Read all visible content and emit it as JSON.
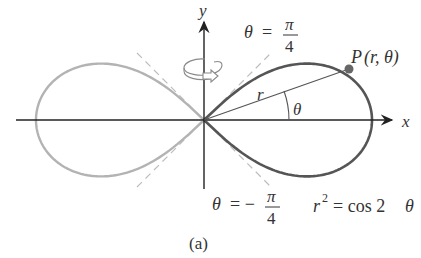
{
  "figure": {
    "caption": "(a)",
    "equation": {
      "lhs_var": "r",
      "exponent": "2",
      "rhs": "= cos 2",
      "rhs_var": "θ"
    },
    "axes": {
      "x_label": "x",
      "y_label": "y"
    },
    "upper_asymptote": {
      "var": "θ",
      "eq": "=",
      "num": "π",
      "den": "4"
    },
    "lower_asymptote": {
      "var": "θ",
      "eq": "= −",
      "num": "π",
      "den": "4"
    },
    "point": {
      "label": "P(r, θ)",
      "P": "P",
      "args": "(r, θ)"
    },
    "radius_label": "r",
    "angle_label": "θ",
    "rotation_icon": "rotate-about-y-axis-icon",
    "colors": {
      "curve_right": "#555555",
      "curve_left": "#b3b3b3",
      "dashed": "#bdbdbd",
      "axes": "#222222",
      "point": "#666666",
      "text": "#333333"
    }
  }
}
